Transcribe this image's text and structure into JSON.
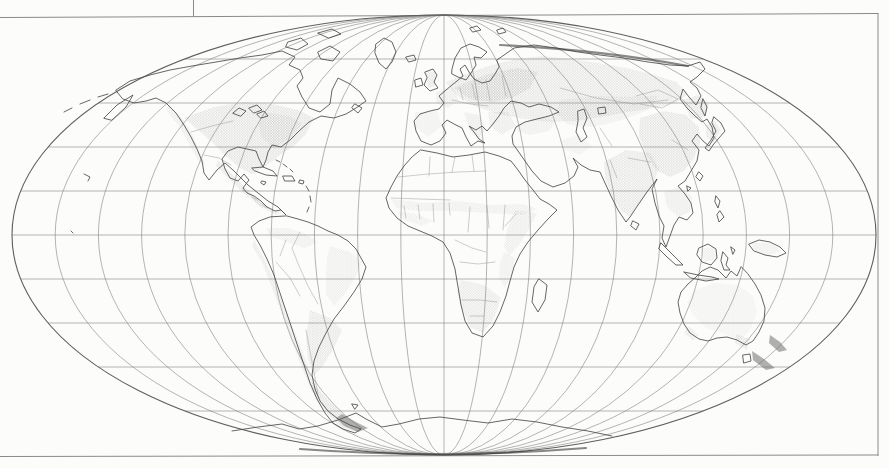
{
  "meta": {
    "figure_kind": "scanned-book-figure",
    "visible_text": [],
    "colors": {
      "paper": "#fcfcfa",
      "frame_line": "#8a8a8a",
      "graticule_line": "#787878",
      "ellipse_boundary": "#5f5f5f",
      "coastline": "#4a4a4a",
      "country_border": "#919191",
      "halftone_dot": "#888888",
      "dark_fill": "#6f6f6f"
    }
  },
  "map": {
    "layers": [
      {
        "name": "frame",
        "kind": "stroke",
        "color": "#8a8a8a",
        "width": 1,
        "paths": [
          {
            "name": "frame-top-line",
            "d": "M 0,17.5 L 878,13.5"
          },
          {
            "name": "frame-right-line",
            "d": "M 878,13.5 L 878,455.5"
          },
          {
            "name": "frame-bottom-line",
            "d": "M 0,456.5 L 878,455"
          },
          {
            "name": "page-artifact-line",
            "d": "M 193.5,0 L 193.5,16.5"
          }
        ]
      },
      {
        "name": "graticule",
        "kind": "graticule",
        "cx": 444,
        "cy": 235,
        "rx": 432,
        "ry": 220,
        "meridian_pairs": 9,
        "parallel_step": 44,
        "parallels_each_side": 4,
        "stroke": "#787878",
        "width": 0.55,
        "boundary_stroke": "#5f5f5f",
        "boundary_width": 1.1
      },
      {
        "name": "shading",
        "kind": "pattern",
        "pattern": "halftone",
        "paths": [
          {
            "name": "shade-na-west-coast",
            "opacity": 0.35,
            "d": "M 168,104 L 182,118 L 192,134 L 200,152 L 206,166 L 199,162 L 189,144 L 179,126 L 167,112 Z"
          },
          {
            "name": "shade-na-main",
            "opacity": 0.5,
            "d": "M 184,118 L 214,107 L 244,102 L 272,104 L 298,110 L 314,118 L 306,134 L 294,146 L 280,155 L 266,166 L 252,174 L 240,168 L 226,156 L 212,142 L 198,130 Z"
          },
          {
            "name": "shade-na-east-dense",
            "opacity": 0.35,
            "d": "M 262,112 L 290,116 L 302,124 L 290,138 L 274,148 L 262,138 L 258,124 Z"
          },
          {
            "name": "shade-mexico",
            "opacity": 0.45,
            "d": "M 218,160 L 230,172 L 242,184 L 252,194 L 262,202 L 270,208 L 262,208 L 250,198 L 238,188 L 226,176 L 216,166 Z"
          },
          {
            "name": "shade-central-america",
            "opacity": 0.4,
            "d": "M 252,196 L 262,203 L 272,210 L 282,212 L 276,215 L 264,209 L 254,201 Z"
          },
          {
            "name": "shade-sa-north",
            "opacity": 0.3,
            "d": "M 266,228 L 288,228 L 306,234 L 318,242 L 304,248 L 286,242 L 270,236 Z"
          },
          {
            "name": "shade-sa-andes",
            "opacity": 0.42,
            "d": "M 254,240 L 264,258 L 274,280 L 284,304 L 294,330 L 304,356 L 312,378 L 320,398 L 312,392 L 302,368 L 292,342 L 282,314 L 272,288 L 262,262 L 252,246 Z"
          },
          {
            "name": "shade-sa-east-brazil",
            "opacity": 0.3,
            "d": "M 330,246 L 350,252 L 362,262 L 356,276 L 346,292 L 334,306 L 326,294 L 326,274 L 327,258 Z"
          },
          {
            "name": "shade-sa-pampas",
            "opacity": 0.45,
            "d": "M 310,310 L 330,318 L 342,330 L 334,348 L 324,364 L 314,376 L 308,360 L 306,338 Z"
          },
          {
            "name": "shade-sa-patagonia",
            "opacity": 0.55,
            "d": "M 312,382 L 326,398 L 340,412 L 354,422 L 366,428 L 356,432 L 340,426 L 326,412 L 314,396 Z"
          },
          {
            "name": "shade-europe-russia-band",
            "opacity": 0.45,
            "d": "M 446,82 L 468,73 L 492,65 L 516,59 L 542,56 L 570,59 L 598,63 L 626,68 L 652,74 L 676,82 L 688,94 L 676,103 L 654,108 L 628,112 L 602,117 L 576,121 L 550,122 L 524,119 L 498,114 L 474,106 L 456,95 Z"
          },
          {
            "name": "shade-east-europe-core",
            "opacity": 0.5,
            "d": "M 454,88 L 474,79 L 496,72 L 518,68 L 538,72 L 530,88 L 512,98 L 492,102 L 470,99 Z"
          },
          {
            "name": "shade-britain",
            "opacity": 0.45,
            "d": "M 426,71 L 436,72 L 435,86 L 428,88 Z"
          },
          {
            "name": "shade-france",
            "opacity": 0.35,
            "d": "M 436,92 L 452,87 L 459,100 L 448,108 L 436,103 Z"
          },
          {
            "name": "shade-iberia",
            "opacity": 0.28,
            "d": "M 415,112 L 437,111 L 442,126 L 428,137 L 415,127 Z"
          },
          {
            "name": "shade-italy",
            "opacity": 0.38,
            "d": "M 464,112 L 479,115 L 486,129 L 478,140 L 470,131 Z"
          },
          {
            "name": "shade-balkans",
            "opacity": 0.38,
            "d": "M 488,112 L 508,112 L 516,126 L 502,135 L 490,126 Z"
          },
          {
            "name": "shade-turkey",
            "opacity": 0.32,
            "d": "M 518,123 L 542,117 L 556,121 L 549,131 L 530,135 L 517,131 Z"
          },
          {
            "name": "shade-central-asia",
            "opacity": 0.3,
            "d": "M 560,100 L 594,96 L 628,97 L 658,96 L 648,110 L 622,120 L 594,127 L 568,125 L 556,112 Z"
          },
          {
            "name": "shade-middle-east",
            "opacity": 0.25,
            "d": "M 560,140 L 580,135 L 592,146 L 580,155 L 563,149 Z"
          },
          {
            "name": "shade-india",
            "opacity": 0.45,
            "d": "M 604,162 L 626,150 L 650,153 L 659,169 L 652,186 L 640,202 L 630,216 L 622,212 L 612,196 L 605,178 Z"
          },
          {
            "name": "shade-china",
            "opacity": 0.5,
            "d": "M 640,118 L 664,111 L 686,115 L 699,127 L 700,143 L 694,158 L 684,171 L 670,177 L 656,170 L 646,154 L 639,136 Z"
          },
          {
            "name": "shade-manchuria",
            "opacity": 0.5,
            "d": "M 682,100 L 698,95 L 709,103 L 705,117 L 691,119 Z"
          },
          {
            "name": "shade-korea-japan",
            "opacity": 0.45,
            "d": "M 706,125 L 715,121 L 721,130 L 714,142 L 706,137 Z"
          },
          {
            "name": "shade-southeast-asia",
            "opacity": 0.35,
            "d": "M 664,192 L 680,187 L 692,197 L 690,212 L 678,217 L 667,207 Z"
          },
          {
            "name": "shade-indonesia",
            "opacity": 0.3,
            "d": "M 700,249 L 714,247 L 717,259 L 704,262 Z"
          },
          {
            "name": "shade-new-guinea",
            "opacity": 0.3,
            "d": "M 752,243 L 772,243 L 781,251 L 766,256 L 753,249 Z"
          },
          {
            "name": "shade-sahel",
            "opacity": 0.3,
            "d": "M 391,199 L 424,203 L 458,201 L 492,205 L 524,204 L 537,209 L 522,215 L 488,213 L 454,211 L 420,211 L 396,208 Z"
          },
          {
            "name": "shade-ethiopia",
            "opacity": 0.33,
            "d": "M 515,210 L 537,213 L 529,229 L 519,245 L 509,256 L 504,246 L 508,227 Z"
          },
          {
            "name": "shade-east-africa",
            "opacity": 0.3,
            "d": "M 504,252 L 515,258 L 511,274 L 505,288 L 499,278 L 500,263 Z"
          },
          {
            "name": "shade-southern-africa",
            "opacity": 0.4,
            "d": "M 461,280 L 484,285 L 501,298 L 494,318 L 483,333 L 470,327 L 461,306 L 457,291 Z"
          },
          {
            "name": "shade-west-africa",
            "opacity": 0.28,
            "d": "M 396,211 L 420,215 L 433,221 L 422,226 L 404,220 Z"
          },
          {
            "name": "shade-australia-center",
            "opacity": 0.22,
            "d": "M 694,290 L 716,283 L 738,285 L 753,296 L 757,312 L 750,330 L 740,340 L 724,334 L 706,328 L 694,316 L 687,302 Z"
          },
          {
            "name": "shade-australia-southeast",
            "opacity": 0.45,
            "d": "M 736,334 L 750,339 L 747,350 L 735,343 Z"
          },
          {
            "name": "shade-australia-southwest",
            "opacity": 0.4,
            "d": "M 688,326 L 699,335 L 693,341 L 684,333 Z"
          }
        ]
      },
      {
        "name": "dark-fills",
        "kind": "fill",
        "color": "#6f6f6f",
        "paths": [
          {
            "name": "fill-new-zealand-north",
            "opacity": 0.55,
            "d": "M 770,335 L 780,342 L 787,350 L 779,352 L 769,343 Z"
          },
          {
            "name": "fill-new-zealand-south",
            "opacity": 0.55,
            "d": "M 752,351 L 764,359 L 775,368 L 766,370 L 753,360 Z"
          },
          {
            "name": "fill-tierra-del-fuego",
            "opacity": 0.5,
            "d": "M 342,414 L 356,422 L 368,428 L 358,432 L 344,426 L 336,418 Z"
          }
        ]
      },
      {
        "name": "coastlines",
        "kind": "stroke",
        "color": "#4a4a4a",
        "width": 0.85,
        "paths": [
          {
            "name": "coast-north-america",
            "d": "M 116,90 L 130,81 L 150,75 L 170,70 L 192,66 L 216,62 L 240,58 L 262,55 L 282,51 L 295,57 L 289,65 L 300,70 L 303,78 L 297,86 L 302,97 L 309,108 L 320,112 L 330,104 L 332,90 L 338,78 L 350,84 L 360,92 L 366,101 L 356,108 L 346,114 L 334,118 L 321,116 L 309,122 L 299,131 L 290,140 L 281,147 L 272,145 L 268,152 L 266,160 L 263,167 L 259,159 L 256,151 L 247,149 L 238,147 L 228,151 L 222,159 L 225,169 L 230,178 L 238,181 L 244,174 L 249,180 L 243,188 L 247,193 L 254,196 L 261,201 L 267,207 L 275,211 L 281,210 L 286,215 L 278,207 L 268,201 L 258,193 L 248,185 L 240,177 L 233,170 L 225,163 L 217,170 L 209,180 L 204,173 L 202,161 L 197,149 L 191,137 L 184,125 L 176,113 L 166,103 L 156,98 L 146,101 L 134,103 L 123,99 Z"
          },
          {
            "name": "coast-arctic-islands",
            "d": "M 318,52 L 330,46 L 340,52 L 333,61 L 321,59 Z M 288,42 L 301,38 L 308,44 L 297,50 L 286,47 Z M 318,33 L 332,29 L 341,34 L 329,38 Z M 355,104 L 362,108 L 358,113 L 352,108 Z"
          },
          {
            "name": "coast-greenland-iceland",
            "d": "M 376,44 L 384,38 L 392,42 L 396,52 L 392,62 L 386,69 L 379,63 L 375,53 Z M 406,57 L 414,55 L 416,60 L 409,62 Z"
          },
          {
            "name": "coast-great-lakes",
            "d": "M 233,113 L 239,108 L 246,111 L 241,116 Z M 249,108 L 257,105 L 262,110 L 254,113 Z M 257,114 L 264,111 L 268,116 L 261,118 Z"
          },
          {
            "name": "coast-caribbean",
            "d": "M 252,168 L 263,167 L 273,171 L 277,176 L 266,175 L 255,171 Z M 283,176 L 292,176 L 295,181 L 285,181 Z M 300,180 L 304,181 L 303,184 L 299,183 Z M 262,181 L 266,182 L 264,185 L 261,183 Z M 306,186 L 309,191 M 310,196 L 311,202 M 309,207 L 307,212 M 276,160 L 280,162 M 283,164 L 287,167 M 290,169 L 293,172"
          },
          {
            "name": "coast-south-america",
            "d": "M 287,216 L 298,219 L 308,222 L 318,226 L 328,231 L 338,235 L 348,241 L 356,249 L 361,258 L 366,267 L 362,279 L 354,292 L 344,306 L 334,319 L 326,333 L 319,347 L 314,361 L 312,375 L 315,389 L 320,401 L 328,411 L 338,419 L 350,425 L 361,429 L 355,433 L 343,429 L 333,423 L 325,413 L 317,399 L 310,383 L 304,365 L 298,347 L 292,329 L 286,311 L 280,293 L 274,275 L 267,259 L 260,245 L 254,235 L 251,227 L 259,221 L 270,217 Z M 352,404 L 358,405 L 355,409 Z"
          },
          {
            "name": "coast-africa",
            "d": "M 421,150 L 437,153 L 453,157 L 469,155 L 485,152 L 499,156 L 511,161 L 518,170 L 525,180 L 533,190 L 540,199 L 549,204 L 557,210 L 548,219 L 538,230 L 528,242 L 520,254 L 514,267 L 510,281 L 506,296 L 500,312 L 493,326 L 483,337 L 472,333 L 465,321 L 461,305 L 458,287 L 455,269 L 450,253 L 443,242 L 432,236 L 420,231 L 408,226 L 397,218 L 389,208 L 386,198 L 391,187 L 397,176 L 404,166 L 412,157 Z"
          },
          {
            "name": "coast-madagascar",
            "d": "M 539,279 L 547,285 L 545,300 L 538,312 L 532,302 L 534,287 Z"
          },
          {
            "name": "coast-eurasia",
            "d": "M 497,60 L 514,48 L 534,45 L 556,48 L 578,52 L 600,55 L 624,58 L 648,62 L 670,65 L 688,66 L 700,62 L 705,69 L 697,77 L 690,82 L 697,88 L 701,96 L 696,105 L 689,97 L 683,89 L 680,99 L 687,108 L 695,116 L 702,122 L 707,119 L 712,127 L 714,138 L 709,146 L 703,141 L 697,134 L 692,141 L 699,150 L 697,161 L 691,171 L 685,181 L 678,186 L 685,194 L 691,203 L 693,213 L 687,220 L 679,217 L 674,225 L 670,236 L 666,247 L 662,238 L 664,226 L 659,216 L 655,203 L 652,189 L 657,179 L 647,192 L 638,205 L 630,217 L 626,222 L 618,210 L 611,196 L 605,183 L 600,172 L 590,170 L 581,165 L 573,158 L 578,167 L 574,176 L 565,183 L 553,187 L 541,181 L 532,171 L 525,161 L 518,151 L 513,144 L 512,136 L 516,127 L 525,122 L 537,119 L 549,116 L 559,112 L 551,107 L 539,104 L 529,107 L 521,103 L 511,101 L 504,108 L 499,116 L 493,124 L 487,131 L 482,126 L 476,130 L 469,126 L 474,132 L 479,139 L 485,143 L 478,141 L 471,146 L 466,137 L 462,128 L 454,124 L 447,120 L 442,125 L 446,133 L 440,141 L 431,145 L 421,141 L 416,131 L 414,121 L 420,114 L 430,111 L 439,109 L 444,103 L 439,96 L 446,90 L 452,85 L 457,81 L 463,76 L 460,69 L 465,65 L 469,72 L 474,79 L 482,83 L 490,81 L 495,74 L 499,67 Z"
          },
          {
            "name": "coast-scandinavia",
            "d": "M 452,69 L 455,58 L 461,48 L 470,44 L 479,47 L 487,52 L 481,58 L 474,57 L 476,65 L 471,73 L 466,80 L 458,77 L 452,74 Z"
          },
          {
            "name": "coast-britain-ireland",
            "d": "M 425,72 L 433,69 L 437,75 L 434,82 L 438,88 L 430,91 L 424,85 L 427,78 Z M 415,80 L 421,78 L 423,85 L 416,87 Z"
          },
          {
            "name": "coast-caspian-aral",
            "d": "M 578,111 L 584,109 L 587,118 L 583,128 L 587,137 L 581,142 L 576,132 L 578,121 Z M 598,108 L 605,107 L 606,113 L 599,114 Z"
          },
          {
            "name": "coast-south-asia-islands",
            "d": "M 633,221 L 639,224 L 636,230 L 631,226 Z M 699,172 L 703,176 L 700,181 L 696,177 Z M 687,186 L 691,188 L 688,191 Z"
          },
          {
            "name": "coast-japan-sakhalin",
            "d": "M 703,99 L 707,107 L 705,116 L 701,108 Z M 714,117 L 721,123 L 725,131 L 719,138 L 713,145 L 709,151 L 705,148 L 711,140 L 716,131 L 712,123 Z"
          },
          {
            "name": "coast-philippines",
            "d": "M 716,196 L 720,201 L 718,208 L 715,202 Z M 720,211 L 724,217 L 719,222 L 717,215 Z"
          },
          {
            "name": "coast-indonesia",
            "d": "M 661,243 L 669,251 L 677,259 L 683,265 L 676,265 L 667,257 L 659,249 Z M 684,272 L 698,275 L 712,277 L 719,279 L 706,281 L 691,278 Z M 699,248 L 708,244 L 716,249 L 717,258 L 711,265 L 702,262 L 697,255 Z M 723,252 L 728,258 L 726,265 L 730,270 L 724,270 L 721,261 Z M 731,247 L 735,250 L 733,254 Z"
          },
          {
            "name": "coast-new-guinea",
            "d": "M 749,244 L 759,240 L 770,242 L 780,247 L 786,253 L 777,257 L 765,255 L 754,251 Z"
          },
          {
            "name": "coast-australia-tasmania",
            "d": "M 741,267 L 737,276 L 731,271 L 726,278 L 718,270 L 710,267 L 702,271 L 696,277 L 688,284 L 681,292 L 678,302 L 680,313 L 684,324 L 690,333 L 699,339 L 708,341 L 717,338 L 727,337 L 737,340 L 746,345 L 753,341 L 759,332 L 764,321 L 765,308 L 761,295 L 755,284 L 748,274 Z M 743,355 L 750,354 L 751,361 L 744,363 Z"
          },
          {
            "name": "coast-antarctica",
            "d": "M 232,431 L 258,427 L 282,424 L 299,429 L 318,426 L 338,420 L 356,413 L 366,419 L 382,427 L 399,424 L 419,419 L 440,417 L 463,420 L 488,423 L 512,419 L 537,422 L 562,427 L 588,431 L 612,436"
          },
          {
            "name": "coast-siberia-left-edge",
            "d": "M 104,118 L 117,105 L 133,95 L 126,107 L 112,120 Z"
          },
          {
            "name": "coast-aleutians-pacific-islets",
            "d": "M 64,112 L 72,108 M 80,104 L 90,100 M 98,97 L 108,94 M 84,174 L 90,177 L 88,181 M 71,231 L 73,233"
          },
          {
            "name": "coast-svalbard",
            "d": "M 470,28 L 477,26 L 481,30 L 473,32 Z M 497,30 L 503,28 L 506,32 L 499,34 Z"
          }
        ]
      },
      {
        "name": "borders",
        "kind": "stroke",
        "color": "#919191",
        "width": 0.45,
        "paths": [
          {
            "name": "border-us-canada",
            "d": "M 191,132 L 212,126 L 233,121"
          },
          {
            "name": "border-us-mexico",
            "d": "M 204,155 L 219,158 L 231,165"
          },
          {
            "name": "border-central-america",
            "d": "M 243,190 L 248,193 M 252,197 L 257,200 M 262,204 L 267,208"
          },
          {
            "name": "border-africa-north",
            "d": "M 398,177 L 428,174 L 458,172 L 486,171 M 430,157 L 429,176 M 455,157 L 452,172 M 472,155 L 474,171"
          },
          {
            "name": "border-africa-sahel",
            "d": "M 391,198 L 420,199 L 450,200 M 404,206 L 406,218 M 418,205 L 420,219 M 433,204 L 434,222 M 449,203 L 450,215 M 470,207 L 468,232 M 487,206 L 489,228 M 505,205 L 503,230 M 516,214 L 505,226"
          },
          {
            "name": "border-africa-south",
            "d": "M 455,240 L 472,248 L 486,252 M 460,262 L 478,264 L 495,262 M 462,300 L 480,300 L 497,302 M 470,316 L 484,316"
          },
          {
            "name": "border-south-america",
            "d": "M 300,232 L 292,248 L 299,266 L 308,286 L 318,304 M 276,262 L 290,278 L 300,296 M 306,330 L 312,362 L 318,394 M 286,240 L 280,256"
          },
          {
            "name": "border-europe",
            "d": "M 460,88 L 463,100 M 472,84 L 476,100 M 486,80 L 490,100 M 502,76 L 506,96 M 452,100 L 470,104 L 488,106"
          },
          {
            "name": "border-asia",
            "d": "M 560,88 L 596,98 L 634,104 L 668,100 M 636,96 L 658,90 L 678,99 L 662,108 L 640,104 M 610,160 L 617,178 M 628,158 L 650,162 M 600,128 L 612,146 M 672,140 L 688,150"
          }
        ]
      },
      {
        "name": "emphasis",
        "kind": "stroke",
        "color": "#3c3c3c",
        "width": 2.2,
        "opacity": 0.6,
        "paths": [
          {
            "name": "antarctic-rim-dark-band",
            "d": "M 300,449 Q 443,459.5 586,448"
          },
          {
            "name": "north-siberia-dark-coast",
            "d": "M 500,45 Q 600,50 688,66"
          }
        ]
      }
    ]
  }
}
